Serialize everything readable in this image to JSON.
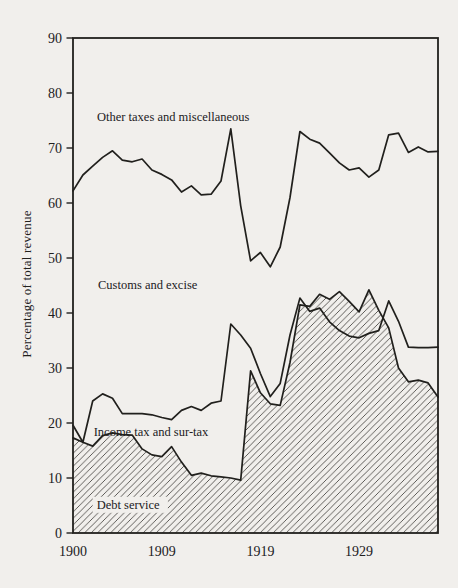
{
  "figure": {
    "paper_color": "#f1efec",
    "ink_color": "#21201d",
    "hatch_color": "#45433f"
  },
  "chart_data": {
    "type": "area",
    "title": "",
    "xlabel": "",
    "ylabel": "Percentage of total revenue",
    "ylim": [
      0,
      90
    ],
    "xlim": [
      1900,
      1937
    ],
    "grid": false,
    "legend": "inline-annotations",
    "y_ticks": [
      90,
      80,
      70,
      60,
      50,
      40,
      30,
      20,
      10,
      0
    ],
    "x_tick_years": [
      1900,
      1909,
      1919,
      1929
    ],
    "years": [
      1900,
      1901,
      1902,
      1903,
      1904,
      1905,
      1906,
      1907,
      1908,
      1909,
      1910,
      1911,
      1912,
      1913,
      1914,
      1915,
      1916,
      1917,
      1918,
      1919,
      1920,
      1921,
      1922,
      1923,
      1924,
      1925,
      1926,
      1927,
      1928,
      1929,
      1930,
      1931,
      1932,
      1933,
      1934,
      1935,
      1936,
      1937
    ],
    "series": [
      {
        "id": "customs_and_excise_upper_boundary",
        "band_above": "Other taxes and miscellaneous",
        "band_below": "Customs and excise",
        "style": "line",
        "values": [
          62.2,
          65.1,
          66.7,
          68.3,
          69.5,
          67.8,
          67.5,
          68.0,
          66.0,
          65.2,
          64.2,
          62.0,
          63.1,
          61.5,
          61.6,
          64.0,
          73.5,
          59.5,
          49.5,
          51.0,
          48.4,
          52.0,
          61.0,
          73.0,
          71.6,
          70.9,
          69.1,
          67.3,
          66.0,
          66.4,
          64.7,
          66.0,
          72.4,
          72.7,
          69.2,
          70.2,
          69.3,
          69.4
        ]
      },
      {
        "id": "income_tax_and_surtax",
        "label": "Income tax and sur-tax",
        "style": "line",
        "values": [
          19.6,
          16.5,
          24.0,
          25.3,
          24.5,
          21.7,
          21.7,
          21.7,
          21.5,
          21.0,
          20.6,
          22.3,
          23.0,
          22.3,
          23.6,
          24.0,
          38.0,
          36.0,
          33.6,
          29.0,
          24.8,
          27.2,
          36.0,
          42.7,
          40.3,
          40.9,
          38.4,
          36.8,
          35.8,
          35.5,
          36.3,
          36.8,
          42.2,
          38.5,
          33.8,
          33.7,
          33.7,
          33.8
        ]
      },
      {
        "id": "debt_service",
        "label": "Debt service",
        "style": "hatched_area",
        "values": [
          17.3,
          16.5,
          15.8,
          17.7,
          18.2,
          17.9,
          17.8,
          15.3,
          14.2,
          13.9,
          15.7,
          12.9,
          10.5,
          10.9,
          10.4,
          10.2,
          10.0,
          9.6,
          29.5,
          25.5,
          23.5,
          23.2,
          31.0,
          41.5,
          41.2,
          43.4,
          42.5,
          43.9,
          42.1,
          40.2,
          44.2,
          40.5,
          37.3,
          30.0,
          27.5,
          27.8,
          27.3,
          24.7
        ]
      }
    ],
    "annotations": [
      {
        "text": "Other taxes and miscellaneous",
        "year": 1902.43,
        "value": 74.9,
        "knockout": false
      },
      {
        "text": "Customs and excise",
        "year": 1902.53,
        "value": 44.4,
        "knockout": false
      },
      {
        "text": "Income tax and sur-tax",
        "year": 1902.1,
        "value": 17.6,
        "knockout": false
      },
      {
        "text": "Debt service",
        "year": 1902.4,
        "value": 4.4,
        "knockout": true
      }
    ]
  }
}
